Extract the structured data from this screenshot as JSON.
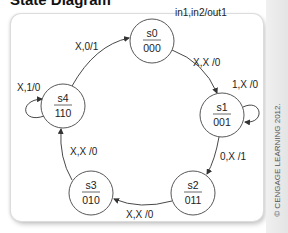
{
  "title": "State Diagram",
  "legend": "in1,in2/out1",
  "copyright": "© CENGAGE LEARNING 2012.",
  "states": [
    {
      "name": "s0",
      "code": "000"
    },
    {
      "name": "s1",
      "code": "001"
    },
    {
      "name": "s2",
      "code": "011"
    },
    {
      "name": "s3",
      "code": "010"
    },
    {
      "name": "s4",
      "code": "110"
    }
  ],
  "transitions": [
    {
      "from": "s0",
      "to": "s1",
      "label": "X,X /0"
    },
    {
      "from": "s1",
      "to": "s1",
      "label": "1,X /0"
    },
    {
      "from": "s1",
      "to": "s2",
      "label": "0,X /1"
    },
    {
      "from": "s2",
      "to": "s3",
      "label": "X,X /0"
    },
    {
      "from": "s3",
      "to": "s4",
      "label": "X,X /0"
    },
    {
      "from": "s4",
      "to": "s4",
      "label": "X,1/0"
    },
    {
      "from": "s4",
      "to": "s0",
      "label": "X,0/1"
    }
  ],
  "colors": {
    "line": "#333333",
    "text": "#222222",
    "panel_border": "#dcdcdc"
  }
}
